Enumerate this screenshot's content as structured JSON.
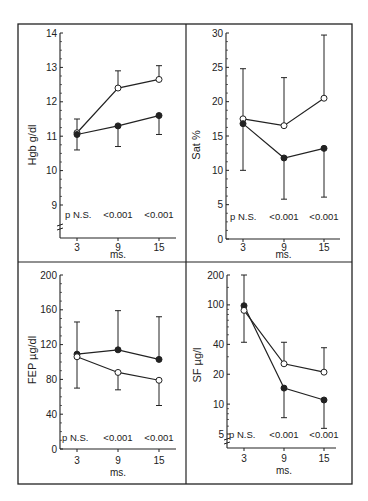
{
  "figure": {
    "frame": {
      "left": 18,
      "top": 24,
      "right": 352,
      "bottom": 484,
      "vdivider": 186,
      "hdivider": 262
    },
    "colors": {
      "ink": "#222222",
      "background": "#ffffff"
    },
    "legend_markers": {
      "open_circle": "open-circle-series",
      "filled_circle": "filled-circle-series"
    }
  },
  "chart_data": [
    {
      "type": "line",
      "panel": "top-left",
      "ylabel": "Hgb  g/dl",
      "xlabel": "ms.",
      "x": [
        3,
        9,
        15
      ],
      "x_ticks": [
        "3",
        "9",
        "15"
      ],
      "y_ticks": [
        "9",
        "10",
        "11",
        "12",
        "13",
        "14"
      ],
      "ylim": [
        8.3,
        14
      ],
      "yscale": "linear",
      "axis_break": true,
      "p_values": [
        "p  N.S.",
        "<0.001",
        "<0.001"
      ],
      "series": [
        {
          "name": "open",
          "marker": "open-circle",
          "values": [
            11.1,
            12.4,
            12.65
          ],
          "err_upper": [
            11.5,
            12.9,
            13.05
          ],
          "err_lower": null
        },
        {
          "name": "filled",
          "marker": "filled-circle",
          "values": [
            11.05,
            11.3,
            11.6
          ],
          "err_upper": null,
          "err_lower": [
            10.6,
            10.7,
            11.05
          ]
        }
      ],
      "geom": {
        "yaxis_x": 60,
        "xaxis_y": 238,
        "x_px": [
          77,
          118,
          159
        ],
        "ref": [
          [
            14,
            33
          ],
          [
            9,
            205
          ]
        ],
        "xaxis_x_end": 176,
        "ylabel_x": 36,
        "ylabel_y": 145,
        "p_y": 218,
        "p_x": [
          65,
          118,
          159
        ],
        "xlabel_y": 258,
        "xtick_label_y": 251,
        "break_y": 228
      }
    },
    {
      "type": "line",
      "panel": "top-right",
      "ylabel": "Sat  %",
      "xlabel": "ms.",
      "x": [
        3,
        9,
        15
      ],
      "x_ticks": [
        "3",
        "9",
        "15"
      ],
      "y_ticks": [
        "0",
        "5",
        "10",
        "15",
        "20",
        "25",
        "30"
      ],
      "ylim": [
        0,
        30
      ],
      "yscale": "linear",
      "axis_break": false,
      "p_values": [
        "p  N.S.",
        "<0.001",
        "<0.001"
      ],
      "series": [
        {
          "name": "open",
          "marker": "open-circle",
          "values": [
            17.5,
            16.5,
            20.5
          ],
          "err_upper": [
            24.8,
            23.5,
            29.7
          ],
          "err_lower": null
        },
        {
          "name": "filled",
          "marker": "filled-circle",
          "values": [
            16.8,
            11.8,
            13.2
          ],
          "err_upper": null,
          "err_lower": [
            10.0,
            5.8,
            6.1
          ]
        }
      ],
      "geom": {
        "yaxis_x": 226,
        "xaxis_y": 239,
        "x_px": [
          243,
          284,
          324
        ],
        "ref": [
          [
            30,
            33
          ],
          [
            0,
            239
          ]
        ],
        "xaxis_x_end": 340,
        "ylabel_x": 200,
        "ylabel_y": 145,
        "p_y": 220,
        "p_x": [
          230,
          284,
          324
        ],
        "xlabel_y": 258,
        "xtick_label_y": 251,
        "break_y": null
      }
    },
    {
      "type": "line",
      "panel": "bottom-left",
      "ylabel": "FEP  µg/dl",
      "xlabel": "ms.",
      "x": [
        3,
        9,
        15
      ],
      "x_ticks": [
        "3",
        "9",
        "15"
      ],
      "y_ticks": [
        "0",
        "40",
        "80",
        "120",
        "160",
        "200"
      ],
      "ylim": [
        0,
        200
      ],
      "yscale": "linear",
      "axis_break": false,
      "p_values": [
        "p  N.S.",
        "<0.001",
        "<0.001"
      ],
      "series": [
        {
          "name": "filled",
          "marker": "filled-circle",
          "values": [
            109,
            114,
            103
          ],
          "err_upper": [
            146,
            159,
            152
          ],
          "err_lower": null
        },
        {
          "name": "open",
          "marker": "open-circle",
          "values": [
            106,
            88,
            79
          ],
          "err_upper": null,
          "err_lower": [
            70,
            68,
            50
          ]
        }
      ],
      "geom": {
        "yaxis_x": 60,
        "xaxis_y": 449,
        "x_px": [
          77,
          118,
          159
        ],
        "ref": [
          [
            200,
            275
          ],
          [
            0,
            449
          ]
        ],
        "xaxis_x_end": 176,
        "ylabel_x": 36,
        "ylabel_y": 360,
        "p_y": 441,
        "p_x": [
          62,
          118,
          159
        ],
        "xlabel_y": 476,
        "xtick_label_y": 464,
        "break_y": null
      }
    },
    {
      "type": "line",
      "panel": "bottom-right",
      "ylabel": "SF  µg/l",
      "xlabel": "ms.",
      "x": [
        3,
        9,
        15
      ],
      "x_ticks": [
        "3",
        "9",
        "15"
      ],
      "y_ticks": [
        "5",
        "10",
        "20",
        "40",
        "100",
        "200"
      ],
      "ylim": [
        4.5,
        200
      ],
      "yscale": "log",
      "axis_break": true,
      "p_values": [
        "p  N.S.",
        "<0.001",
        "<0.001"
      ],
      "series": [
        {
          "name": "filled",
          "marker": "filled-circle",
          "values": [
            98,
            14.5,
            11
          ],
          "err_upper": [
            200,
            null,
            null
          ],
          "err_lower": [
            42,
            7.3,
            5.7
          ]
        },
        {
          "name": "open",
          "marker": "open-circle",
          "values": [
            88,
            25.5,
            21
          ],
          "err_upper": [
            null,
            42,
            37
          ],
          "err_lower": null
        }
      ],
      "geom": {
        "yaxis_x": 227,
        "xaxis_y": 448,
        "x_px": [
          244,
          284,
          324
        ],
        "ref": [
          [
            200,
            275
          ],
          [
            5,
            434
          ]
        ],
        "xaxis_x_end": 336,
        "ylabel_x": 201,
        "ylabel_y": 365,
        "p_y": 438,
        "p_x": [
          229,
          284,
          324
        ],
        "xlabel_y": 474,
        "xtick_label_y": 462,
        "break_y": 442
      }
    }
  ]
}
